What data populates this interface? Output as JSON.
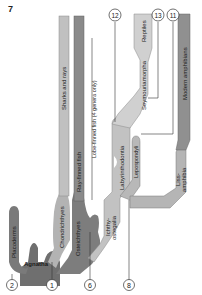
{
  "figure": {
    "number": "7",
    "colors": {
      "dark": "#6f6f6f",
      "medium": "#9a9a9a",
      "light": "#c4c4c4",
      "lighter": "#d6d6d6",
      "line": "#444444",
      "text": "#1a1a1a"
    },
    "branches": {
      "placoderms": "Placoderms",
      "agnatha": "Agnatha",
      "chondrichthyes": "Chondrichthyes",
      "sharks_and_rays": "Sharks and rays",
      "osteichthyes": "Osteichthyes",
      "ray_finned_fish": "Ray-finned fish",
      "lobe_finned_fish": "Lobe-finned fish (4 genera only)",
      "ichthyostegalia_1": "Ichthy-",
      "ichthyostegalia_2": "ostegalia",
      "labyrinthodontia": "Labyrinthodontia",
      "lepospondyli": "Lepospondyli",
      "seymouriamorpha": "Seymouriamorpha",
      "reptiles": "Reptiles",
      "lissamphibia_1": "Liss-",
      "lissamphibia_2": "amphibia",
      "modern_amphibians": "Modern amphibians"
    },
    "callouts": [
      "2",
      "1",
      "6",
      "8",
      "12",
      "13",
      "11"
    ]
  }
}
